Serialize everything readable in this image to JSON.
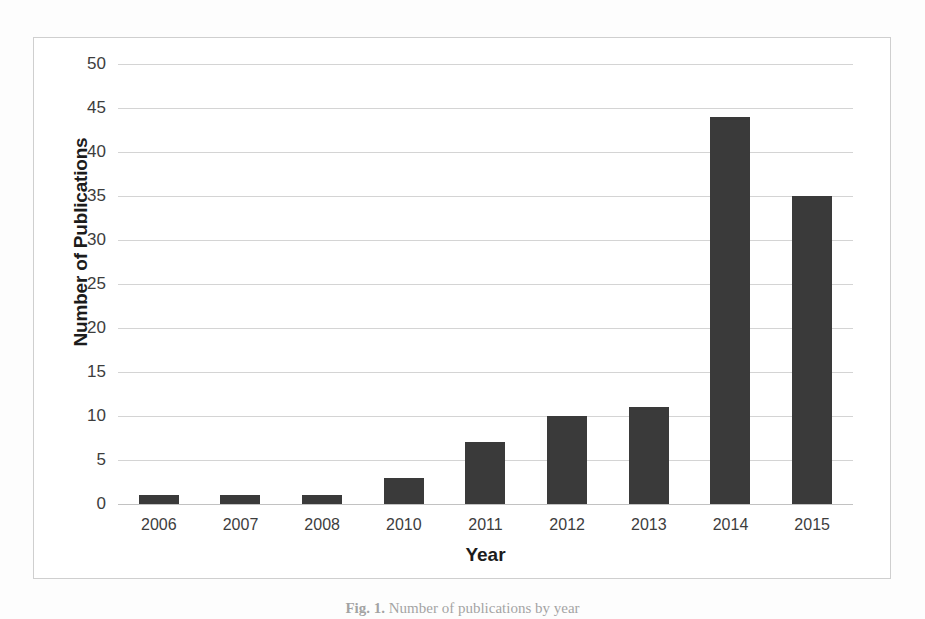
{
  "figure": {
    "caption_label": "Fig. 1.",
    "caption_text": "Number of publications by year"
  },
  "chart_data": {
    "type": "bar",
    "title": "",
    "xlabel": "Year",
    "ylabel": "Number of Publications",
    "categories": [
      "2006",
      "2007",
      "2008",
      "2010",
      "2011",
      "2012",
      "2013",
      "2014",
      "2015"
    ],
    "values": [
      1,
      1,
      1,
      3,
      7,
      10,
      11,
      44,
      35
    ],
    "ylim": [
      0,
      50
    ],
    "ytick_step": 5,
    "yticks": [
      "50",
      "45",
      "40",
      "35",
      "30",
      "25",
      "20",
      "15",
      "10",
      "5",
      "0"
    ],
    "grid": true,
    "legend": "none",
    "bar_color": "#3a3a3a",
    "gridline_color": "#d4d4d4",
    "plot_background": "#ffffff",
    "frame_color": "#cfcfcf"
  }
}
